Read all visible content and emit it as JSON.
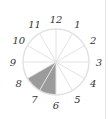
{
  "diagram": {
    "type": "clock-fraction",
    "sectors": 12,
    "shaded_sectors": [
      7,
      8
    ],
    "shade_color": "#9b9b9b",
    "line_color": "#e2e2e2",
    "labels": [
      "12",
      "1",
      "2",
      "3",
      "4",
      "5",
      "6",
      "7",
      "8",
      "9",
      "10",
      "11"
    ]
  }
}
